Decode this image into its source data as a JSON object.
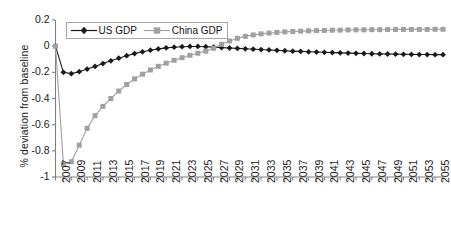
{
  "chart_data": {
    "type": "line",
    "title": "",
    "subtitle": "",
    "xlabel": "",
    "ylabel": "% deviation from baseline",
    "ylim": [
      -1,
      0.2
    ],
    "xlim": [
      2007,
      2056
    ],
    "grid": false,
    "legend_position": "top-left-inside",
    "y_ticks": [
      "0.2",
      "0",
      "-0.2",
      "-0.4",
      "-0.6",
      "-0.8",
      "-1"
    ],
    "y_tick_values": [
      0.2,
      0,
      -0.2,
      -0.4,
      -0.6,
      -0.8,
      -1
    ],
    "x_tick_labels": [
      "2007",
      "2009",
      "2011",
      "2013",
      "2015",
      "2017",
      "2019",
      "2021",
      "2023",
      "2025",
      "2027",
      "2029",
      "2031",
      "2033",
      "2035",
      "2037",
      "2039",
      "2041",
      "2043",
      "2045",
      "2047",
      "2049",
      "2051",
      "2053",
      "2055"
    ],
    "x": [
      2007,
      2008,
      2009,
      2010,
      2011,
      2012,
      2013,
      2014,
      2015,
      2016,
      2017,
      2018,
      2019,
      2020,
      2021,
      2022,
      2023,
      2024,
      2025,
      2026,
      2027,
      2028,
      2029,
      2030,
      2031,
      2032,
      2033,
      2034,
      2035,
      2036,
      2037,
      2038,
      2039,
      2040,
      2041,
      2042,
      2043,
      2044,
      2045,
      2046,
      2047,
      2048,
      2049,
      2050,
      2051,
      2052,
      2053,
      2054,
      2055,
      2056
    ],
    "series": [
      {
        "name": "US GDP",
        "color": "#1a1a1a",
        "marker": "diamond",
        "values": [
          0,
          -0.2,
          -0.21,
          -0.195,
          -0.175,
          -0.155,
          -0.133,
          -0.112,
          -0.092,
          -0.073,
          -0.057,
          -0.043,
          -0.031,
          -0.021,
          -0.013,
          -0.008,
          -0.004,
          -0.002,
          -0.002,
          -0.004,
          -0.007,
          -0.011,
          -0.014,
          -0.017,
          -0.02,
          -0.023,
          -0.026,
          -0.029,
          -0.032,
          -0.035,
          -0.038,
          -0.04,
          -0.043,
          -0.045,
          -0.047,
          -0.049,
          -0.051,
          -0.053,
          -0.055,
          -0.056,
          -0.058,
          -0.059,
          -0.06,
          -0.061,
          -0.062,
          -0.063,
          -0.064,
          -0.064,
          -0.065,
          -0.065
        ]
      },
      {
        "name": "China GDP",
        "color": "#a0a0a0",
        "marker": "square",
        "values": [
          0,
          -0.905,
          -0.883,
          -0.757,
          -0.628,
          -0.531,
          -0.46,
          -0.4,
          -0.343,
          -0.293,
          -0.25,
          -0.214,
          -0.182,
          -0.154,
          -0.13,
          -0.108,
          -0.088,
          -0.07,
          -0.054,
          -0.038,
          -0.016,
          0.014,
          0.04,
          0.06,
          0.075,
          0.086,
          0.094,
          0.1,
          0.105,
          0.109,
          0.112,
          0.115,
          0.117,
          0.119,
          0.12,
          0.122,
          0.123,
          0.124,
          0.125,
          0.125,
          0.126,
          0.126,
          0.127,
          0.127,
          0.128,
          0.128,
          0.128,
          0.128,
          0.129,
          0.129
        ]
      }
    ]
  },
  "legend": {
    "entries": [
      {
        "label": "US GDP",
        "marker": "diamond-marker",
        "color": "#1a1a1a"
      },
      {
        "label": "China GDP",
        "marker": "square-marker",
        "color": "#a0a0a0"
      }
    ]
  }
}
